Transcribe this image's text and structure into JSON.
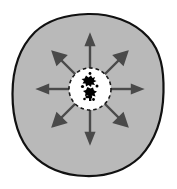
{
  "figure": {
    "background_color": "#ffffff",
    "width": 177,
    "height": 189
  },
  "outer_region": {
    "name": "dispersal-area",
    "shape": "irregular-circle",
    "fill_color": "#b9b9b9",
    "stroke_color": "#111111",
    "stroke_width": 2.2,
    "center_x": 88,
    "center_y": 95,
    "radius_x": 76,
    "radius_y": 81
  },
  "inner_region": {
    "name": "source-patch",
    "shape": "dashed-circle",
    "fill_color": "#ffffff",
    "stroke_color": "#1a1a1a",
    "stroke_width": 1.6,
    "dash_pattern": "3.5 3",
    "center_x": 90,
    "center_y": 89,
    "radius": 21
  },
  "core_cluster": {
    "name": "source-cluster",
    "fill_color": "#000000",
    "description": "irregular black cluster blob at center"
  },
  "arrows": {
    "color": "#4a4a4a",
    "stroke_width": 2.4,
    "head_length": 7,
    "head_width": 6,
    "count": 8,
    "items": [
      {
        "label": "N",
        "angle_deg": 270,
        "start_radius": 14,
        "end_radius": 52
      },
      {
        "label": "NE",
        "angle_deg": 315,
        "start_radius": 14,
        "end_radius": 50
      },
      {
        "label": "E",
        "angle_deg": 0,
        "start_radius": 14,
        "end_radius": 51
      },
      {
        "label": "SE",
        "angle_deg": 45,
        "start_radius": 14,
        "end_radius": 50
      },
      {
        "label": "S",
        "angle_deg": 90,
        "start_radius": 14,
        "end_radius": 52
      },
      {
        "label": "SW",
        "angle_deg": 135,
        "start_radius": 14,
        "end_radius": 50
      },
      {
        "label": "W",
        "angle_deg": 180,
        "start_radius": 14,
        "end_radius": 51
      },
      {
        "label": "NW",
        "angle_deg": 225,
        "start_radius": 14,
        "end_radius": 50
      }
    ]
  }
}
